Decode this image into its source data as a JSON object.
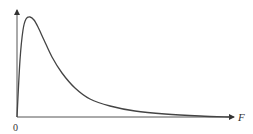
{
  "chart_data": {
    "type": "line",
    "title": "",
    "xlabel": "F",
    "ylabel": "",
    "origin_label": "0",
    "grid": false,
    "legend": null,
    "series": [
      {
        "name": "density",
        "x_px": [
          17,
          20,
          23,
          26,
          30,
          34,
          38,
          44,
          52,
          62,
          75,
          90,
          110,
          135,
          165,
          200,
          230
        ],
        "y_px": [
          117,
          60,
          30,
          19,
          17,
          20,
          27,
          40,
          57,
          73,
          88,
          99,
          106,
          111,
          114,
          116,
          117
        ]
      }
    ],
    "colors": {
      "axis": "#333333",
      "curve": "#444444"
    }
  }
}
